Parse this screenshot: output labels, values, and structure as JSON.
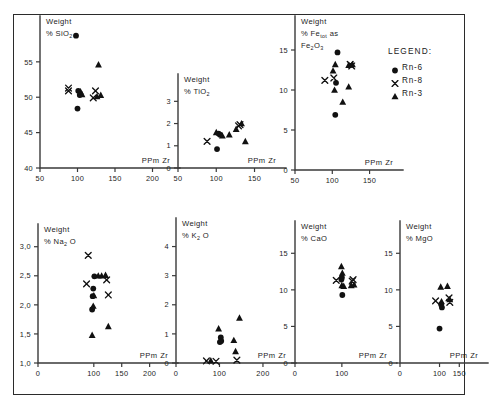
{
  "figure": {
    "legend": {
      "title": "LEGEND:",
      "entries": [
        {
          "symbol": "circle",
          "label": "Rn-6"
        },
        {
          "symbol": "x",
          "label": "Rn-8"
        },
        {
          "symbol": "triangle",
          "label": "Rn-3"
        }
      ]
    }
  },
  "chart_data": [
    {
      "id": "sio2",
      "type": "scatter",
      "title_line1": "Weight",
      "title_line2_prefix": "% SiO",
      "title_line2_sub": "2",
      "xlabel": "PPm  Zr",
      "ylabel": "Weight % SiO2",
      "xlim": [
        50,
        210
      ],
      "ylim": [
        40,
        59.5
      ],
      "xticks": [
        50,
        100,
        150,
        200
      ],
      "xticklabels": [
        "50",
        "100",
        "150",
        "200"
      ],
      "yticks": [
        40,
        45,
        50,
        55
      ],
      "yticklabels": [
        "40",
        "45",
        "50",
        "55"
      ],
      "grid": false,
      "series": [
        {
          "name": "Rn-6",
          "symbol": "circle",
          "points": [
            [
              98,
              58.7
            ],
            [
              101,
              50.9
            ],
            [
              103,
              50.3
            ],
            [
              100,
              48.4
            ]
          ]
        },
        {
          "name": "Rn-8",
          "symbol": "x",
          "points": [
            [
              88,
              51.3
            ],
            [
              88,
              50.9
            ],
            [
              124,
              50.9
            ],
            [
              121,
              49.9
            ]
          ]
        },
        {
          "name": "Rn-3",
          "symbol": "triangle",
          "points": [
            [
              128,
              54.6
            ],
            [
              104,
              50.8
            ],
            [
              106,
              50.4
            ],
            [
              126,
              50.1
            ],
            [
              131,
              50.3
            ]
          ]
        }
      ]
    },
    {
      "id": "tio2",
      "type": "scatter",
      "title_line1": "Weight",
      "title_line2_prefix": "% TiO",
      "title_line2_sub": "2",
      "xlabel": "PPm  Zr",
      "ylabel": "Weight % TiO2",
      "xlim": [
        50,
        165
      ],
      "ylim": [
        0,
        3.6
      ],
      "xticks": [
        50,
        100,
        150
      ],
      "xticklabels": [
        "50",
        "100",
        "150"
      ],
      "yticks": [
        0,
        1,
        2,
        3
      ],
      "yticklabels": [
        "0",
        "1",
        "2",
        "3"
      ],
      "grid": false,
      "series": [
        {
          "name": "Rn-6",
          "symbol": "circle",
          "points": [
            [
              103,
              1.55
            ],
            [
              105,
              1.5
            ],
            [
              101,
              0.85
            ]
          ]
        },
        {
          "name": "Rn-8",
          "symbol": "x",
          "points": [
            [
              88,
              1.2
            ],
            [
              129,
              1.9
            ],
            [
              131,
              1.95
            ]
          ]
        },
        {
          "name": "Rn-3",
          "symbol": "triangle",
          "points": [
            [
              100,
              1.6
            ],
            [
              108,
              1.45
            ],
            [
              117,
              1.5
            ],
            [
              126,
              1.75
            ],
            [
              133,
              2.0
            ],
            [
              138,
              1.2
            ]
          ]
        }
      ]
    },
    {
      "id": "fe2o3",
      "type": "scatter",
      "title_line1": "Weight",
      "title_line2_prefix": "% Fe",
      "title_line2_sub": "tot",
      "title_line2_suffix": "as",
      "title_line3_prefix": "Fe",
      "title_line3_sub1": "2",
      "title_line3_mid": "O",
      "title_line3_sub2": "3",
      "xlabel": "PPm  Zr",
      "ylabel": "Weight % Fe tot as Fe2O3",
      "xlim": [
        50,
        168
      ],
      "ylim": [
        0,
        17.5
      ],
      "xticks": [
        50,
        100,
        150
      ],
      "xticklabels": [
        "50",
        "100",
        "150"
      ],
      "yticks": [
        0,
        5,
        10,
        15
      ],
      "yticklabels": [
        "0",
        "5",
        "10",
        "15"
      ],
      "grid": false,
      "series": [
        {
          "name": "Rn-6",
          "symbol": "circle",
          "points": [
            [
              107,
              14.7
            ],
            [
              105,
              10.9
            ],
            [
              104,
              6.9
            ]
          ]
        },
        {
          "name": "Rn-8",
          "symbol": "x",
          "points": [
            [
              90,
              11.2
            ],
            [
              102,
              11.5
            ],
            [
              124,
              13.2
            ],
            [
              126,
              13.0
            ]
          ]
        },
        {
          "name": "Rn-3",
          "symbol": "triangle",
          "points": [
            [
              104,
              13.2
            ],
            [
              101,
              12.4
            ],
            [
              122,
              13.1
            ],
            [
              127,
              13.2
            ],
            [
              103,
              10.0
            ],
            [
              122,
              10.4
            ],
            [
              114,
              8.5
            ]
          ]
        }
      ]
    },
    {
      "id": "na2o",
      "type": "scatter",
      "title_line1": "Weight",
      "title_line2_prefix": "% Na",
      "title_line2_sub": "2",
      "title_line2_suffix": "O",
      "xlabel": "PPm  Zr",
      "ylabel": "Weight % Na2O",
      "xlim": [
        0,
        215
      ],
      "ylim": [
        1.0,
        3.15
      ],
      "xticks": [
        0,
        100,
        150,
        200
      ],
      "xticklabels": [
        "0",
        "100",
        "150",
        "200"
      ],
      "yticks": [
        1.0,
        1.5,
        2.0,
        2.5,
        3.0
      ],
      "yticklabels": [
        "1,0",
        "1,5",
        "2,0",
        "2,5",
        "3,0"
      ],
      "grid": false,
      "series": [
        {
          "name": "Rn-6",
          "symbol": "circle",
          "points": [
            [
              101,
              2.49
            ],
            [
              99,
              2.28
            ],
            [
              98,
              2.15
            ],
            [
              97,
              1.92
            ]
          ]
        },
        {
          "name": "Rn-8",
          "symbol": "x",
          "points": [
            [
              90,
              2.85
            ],
            [
              87,
              2.36
            ],
            [
              123,
              2.43
            ],
            [
              126,
              2.17
            ]
          ]
        },
        {
          "name": "Rn-3",
          "symbol": "triangle",
          "points": [
            [
              108,
              2.5
            ],
            [
              114,
              2.5
            ],
            [
              121,
              2.51
            ],
            [
              100,
              2.16
            ],
            [
              99,
              1.98
            ],
            [
              97,
              1.48
            ],
            [
              126,
              1.63
            ]
          ]
        }
      ]
    },
    {
      "id": "k2o",
      "type": "scatter",
      "title_line1": "Weight",
      "title_line2_prefix": "% K",
      "title_line2_sub": "2",
      "title_line2_suffix": "O",
      "xlabel": "PPm  Zr",
      "ylabel": "Weight % K2O",
      "xlim": [
        0,
        230
      ],
      "ylim": [
        0,
        4.5
      ],
      "xticks": [
        0,
        100,
        200
      ],
      "xticklabels": [
        "0",
        "100",
        "200"
      ],
      "yticks": [
        0,
        1,
        2,
        3,
        4
      ],
      "yticklabels": [
        "0",
        "1",
        "2",
        "3",
        "4"
      ],
      "grid": false,
      "series": [
        {
          "name": "Rn-6",
          "symbol": "circle",
          "points": [
            [
              103,
              0.88
            ],
            [
              104,
              0.76
            ],
            [
              101,
              0.72
            ]
          ]
        },
        {
          "name": "Rn-8",
          "symbol": "x",
          "points": [
            [
              70,
              0.07
            ],
            [
              92,
              0.06
            ],
            [
              140,
              0.1
            ]
          ]
        },
        {
          "name": "Rn-3",
          "symbol": "triangle",
          "points": [
            [
              146,
              1.55
            ],
            [
              98,
              1.18
            ],
            [
              133,
              0.78
            ],
            [
              137,
              0.4
            ],
            [
              80,
              0.08
            ]
          ]
        }
      ]
    },
    {
      "id": "cao",
      "type": "scatter",
      "title_line1": "Weight",
      "title_line2_prefix": "% CaO",
      "xlabel": "PPm  Zr",
      "ylabel": "Weight % CaO",
      "xlim": [
        0,
        175
      ],
      "ylim": [
        0,
        17.5
      ],
      "xticks": [
        0,
        100
      ],
      "xticklabels": [
        "0",
        "100"
      ],
      "yticks": [
        0,
        5,
        10,
        15
      ],
      "yticklabels": [
        "0",
        "5",
        "10",
        "15"
      ],
      "grid": false,
      "series": [
        {
          "name": "Rn-6",
          "symbol": "circle",
          "points": [
            [
              100,
              11.7
            ],
            [
              99,
              11.4
            ],
            [
              101,
              9.3
            ]
          ]
        },
        {
          "name": "Rn-8",
          "symbol": "x",
          "points": [
            [
              88,
              11.3
            ],
            [
              122,
              11.2
            ],
            [
              124,
              11.4
            ]
          ]
        },
        {
          "name": "Rn-3",
          "symbol": "triangle",
          "points": [
            [
              99,
              13.2
            ],
            [
              101,
              12.3
            ],
            [
              100,
              10.6
            ],
            [
              104,
              10.5
            ],
            [
              120,
              10.6
            ],
            [
              126,
              10.7
            ]
          ]
        }
      ]
    },
    {
      "id": "mgo",
      "type": "scatter",
      "title_line1": "Weight",
      "title_line2_prefix": "% MgO",
      "xlabel": "PPm  Zr",
      "ylabel": "Weight % MgO",
      "xlim": [
        0,
        172
      ],
      "ylim": [
        0,
        17.5
      ],
      "xticks": [
        0,
        100,
        150
      ],
      "xticklabels": [
        "0",
        "100",
        "150"
      ],
      "yticks": [
        0,
        5,
        10,
        15
      ],
      "yticklabels": [
        "0",
        "5",
        "10",
        "15"
      ],
      "grid": false,
      "series": [
        {
          "name": "Rn-6",
          "symbol": "circle",
          "points": [
            [
              104,
              8.0
            ],
            [
              106,
              7.6
            ],
            [
              100,
              4.7
            ]
          ]
        },
        {
          "name": "Rn-8",
          "symbol": "x",
          "points": [
            [
              90,
              8.5
            ],
            [
              124,
              8.9
            ],
            [
              126,
              8.3
            ]
          ]
        },
        {
          "name": "Rn-3",
          "symbol": "triangle",
          "points": [
            [
              103,
              10.4
            ],
            [
              120,
              10.5
            ],
            [
              105,
              8.4
            ],
            [
              126,
              8.7
            ]
          ]
        }
      ]
    }
  ]
}
